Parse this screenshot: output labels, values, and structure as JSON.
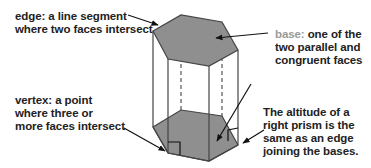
{
  "figure": {
    "colors": {
      "face_fill": "#8f8f8f",
      "edge_stroke": "#444444",
      "text": "#222222",
      "base_term": "#999999"
    },
    "labels": {
      "edge": {
        "term": "edge:",
        "line1_rest": " a line segment",
        "line2": "where two faces intersect"
      },
      "base": {
        "term": "base:",
        "line1_rest": " one of the",
        "line2": "two parallel and",
        "line3": "congruent faces"
      },
      "vertex": {
        "term": "vertex:",
        "line1_rest": " a point",
        "line2": "where three or",
        "line3": "more faces intersect"
      },
      "altitude": {
        "line1": "The altitude of a",
        "line2": "right prism is the",
        "line3": "same as an edge",
        "line4": "joining the bases."
      }
    },
    "shape": "right hexagonal prism"
  }
}
